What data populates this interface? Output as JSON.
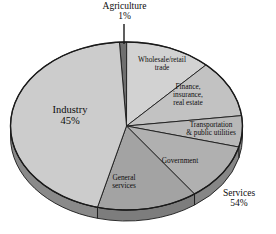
{
  "chart_data": {
    "type": "pie",
    "title": "",
    "subtitle": "",
    "xlabel": "",
    "ylabel": "",
    "legend_position": "none",
    "grid": false,
    "style": "3d-pie-grayscale",
    "categories": [
      "Agriculture",
      "Wholesale/retail trade",
      "Finance, insurance, real estate",
      "Transportation & public utilities",
      "Government",
      "General services",
      "Industry"
    ],
    "values": [
      1,
      12,
      11,
      6,
      11,
      14,
      45
    ],
    "units": "percent",
    "groups": [
      {
        "name": "Agriculture",
        "value": 1,
        "label": "Agriculture",
        "pct_label": "1%"
      },
      {
        "name": "Services",
        "value": 54,
        "label": "Services",
        "pct_label": "54%"
      },
      {
        "name": "Industry",
        "value": 45,
        "label": "Industry",
        "pct_label": "45%"
      }
    ],
    "slices": [
      {
        "name": "Agriculture",
        "value": 1,
        "color": "#6f6f6f",
        "side_color": "#4a4a4a"
      },
      {
        "name": "Wholesale/retail trade",
        "value": 12,
        "color": "#d2d2d2",
        "side_color": "#8d8d8d"
      },
      {
        "name": "Finance, insurance, real estate",
        "value": 11,
        "color": "#c2c2c2",
        "side_color": "#8d8d8d"
      },
      {
        "name": "Transportation & public utilities",
        "value": 6,
        "color": "#b8b8b8",
        "side_color": "#8d8d8d"
      },
      {
        "name": "Government",
        "value": 11,
        "color": "#b0b0b0",
        "side_color": "#868686"
      },
      {
        "name": "General services",
        "value": 14,
        "color": "#a3a3a3",
        "side_color": "#7d7d7d"
      },
      {
        "name": "Industry",
        "value": 45,
        "color": "#cccccc",
        "side_color": "#8a8a8a"
      }
    ]
  },
  "labels": {
    "agriculture": {
      "name": "Agriculture",
      "pct": "1%"
    },
    "wholesale": {
      "line1": "Wholesale/retail",
      "line2": "trade"
    },
    "finance": {
      "line1": "Finance,",
      "line2": "insurance,",
      "line3": "real estate"
    },
    "transportation": {
      "line1": "Transportation",
      "line2": "& public utilities"
    },
    "government": {
      "name": "Government"
    },
    "general_services": {
      "line1": "General",
      "line2": "services"
    },
    "industry": {
      "name": "Industry",
      "pct": "45%"
    },
    "services": {
      "name": "Services",
      "pct": "54%"
    }
  },
  "colors": {
    "outline": "#1a1a1a",
    "background": "#ffffff",
    "leader_line": "#1a1a1a"
  }
}
